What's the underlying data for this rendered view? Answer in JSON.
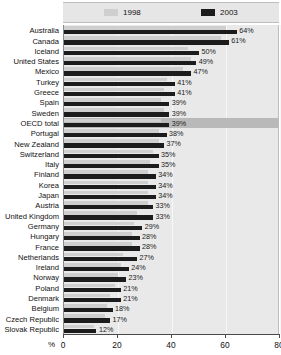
{
  "legend": {
    "entries": [
      {
        "label": "1998",
        "color": "#cfcfcf",
        "icon": "legend-swatch-1998"
      },
      {
        "label": "2003",
        "color": "#1c1c1c",
        "icon": "legend-swatch-2003"
      }
    ]
  },
  "axis": {
    "unit": "%",
    "ticks": [
      "0",
      "20",
      "40",
      "60",
      "80"
    ]
  },
  "chart_data": {
    "type": "bar",
    "orientation": "horizontal",
    "title": "",
    "subtitle": "",
    "xlabel": "%",
    "ylabel": "",
    "xlim": [
      0,
      80
    ],
    "grid": true,
    "legend_position": "top",
    "categories": [
      "Australia",
      "Canada",
      "Iceland",
      "United States",
      "Mexico",
      "Turkey",
      "Greece",
      "Spain",
      "Sweden",
      "OECD total",
      "Portugal",
      "New Zealand",
      "Switzerland",
      "Italy",
      "Finland",
      "Korea",
      "Japan",
      "Austria",
      "United Kingdom",
      "Germany",
      "Hungary",
      "France",
      "Netherlands",
      "Ireland",
      "Norway",
      "Poland",
      "Denmark",
      "Belgium",
      "Czech Republic",
      "Slovak Republic"
    ],
    "highlight_category": "OECD total",
    "series": [
      {
        "name": "1998",
        "color": "#cfcfcf",
        "values": [
          60,
          58,
          46,
          47,
          44,
          38,
          37,
          36,
          37,
          36,
          35,
          35,
          33,
          32,
          31,
          31,
          31,
          31,
          27,
          26,
          25,
          25,
          22,
          21,
          20,
          19,
          17,
          16,
          15,
          11
        ]
      },
      {
        "name": "2003",
        "color": "#1c1c1c",
        "values": [
          64,
          61,
          50,
          49,
          47,
          41,
          41,
          39,
          39,
          39,
          38,
          37,
          35,
          35,
          34,
          34,
          34,
          33,
          33,
          29,
          28,
          28,
          27,
          24,
          23,
          21,
          21,
          18,
          17,
          17
        ],
        "labels": [
          "64%",
          "61%",
          "50%",
          "49%",
          "47%",
          "41%",
          "41%",
          "39%",
          "39%",
          "39%",
          "38%",
          "37%",
          "35%",
          "35%",
          "34%",
          "34%",
          "34%",
          "33%",
          "33%",
          "29%",
          "28%",
          "28%",
          "27%",
          "24%",
          "23%",
          "21%",
          "21%",
          "18%",
          "17%",
          "17%"
        ]
      }
    ],
    "rows": [
      {
        "category": "Australia",
        "v1998": 60,
        "v2003": 64,
        "label": "64%"
      },
      {
        "category": "Canada",
        "v1998": 58,
        "v2003": 61,
        "label": "61%"
      },
      {
        "category": "Iceland",
        "v1998": 46,
        "v2003": 50,
        "label": "50%"
      },
      {
        "category": "United States",
        "v1998": 47,
        "v2003": 49,
        "label": "49%"
      },
      {
        "category": "Mexico",
        "v1998": 44,
        "v2003": 47,
        "label": "47%"
      },
      {
        "category": "Turkey",
        "v1998": 38,
        "v2003": 41,
        "label": "41%"
      },
      {
        "category": "Greece",
        "v1998": 37,
        "v2003": 41,
        "label": "41%"
      },
      {
        "category": "Spain",
        "v1998": 36,
        "v2003": 39,
        "label": "39%"
      },
      {
        "category": "Sweden",
        "v1998": 37,
        "v2003": 39,
        "label": "39%"
      },
      {
        "category": "OECD total",
        "v1998": 36,
        "v2003": 39,
        "label": "39%",
        "highlight": true
      },
      {
        "category": "Portugal",
        "v1998": 35,
        "v2003": 38,
        "label": "38%"
      },
      {
        "category": "New Zealand",
        "v1998": 35,
        "v2003": 37,
        "label": "37%"
      },
      {
        "category": "Switzerland",
        "v1998": 33,
        "v2003": 35,
        "label": "35%"
      },
      {
        "category": "Italy",
        "v1998": 32,
        "v2003": 35,
        "label": "35%"
      },
      {
        "category": "Finland",
        "v1998": 31,
        "v2003": 34,
        "label": "34%"
      },
      {
        "category": "Korea",
        "v1998": 31,
        "v2003": 34,
        "label": "34%"
      },
      {
        "category": "Japan",
        "v1998": 31,
        "v2003": 34,
        "label": "34%"
      },
      {
        "category": "Austria",
        "v1998": 31,
        "v2003": 33,
        "label": "33%"
      },
      {
        "category": "United Kingdom",
        "v1998": 27,
        "v2003": 33,
        "label": "33%"
      },
      {
        "category": "Germany",
        "v1998": 26,
        "v2003": 29,
        "label": "29%"
      },
      {
        "category": "Hungary",
        "v1998": 25,
        "v2003": 28,
        "label": "28%"
      },
      {
        "category": "France",
        "v1998": 25,
        "v2003": 28,
        "label": "28%"
      },
      {
        "category": "Netherlands",
        "v1998": 22,
        "v2003": 27,
        "label": "27%"
      },
      {
        "category": "Ireland",
        "v1998": 21,
        "v2003": 24,
        "label": "24%"
      },
      {
        "category": "Norway",
        "v1998": 20,
        "v2003": 23,
        "label": "23%"
      },
      {
        "category": "Poland",
        "v1998": 19,
        "v2003": 21,
        "label": "21%"
      },
      {
        "category": "Denmark",
        "v1998": 17,
        "v2003": 21,
        "label": "21%"
      },
      {
        "category": "Belgium",
        "v1998": 16,
        "v2003": 18,
        "label": "18%"
      },
      {
        "category": "Czech Republic",
        "v1998": 15,
        "v2003": 17,
        "label": "17%"
      },
      {
        "category": "Slovak Republic",
        "v1998": 11,
        "v2003": 12,
        "label": "12%"
      }
    ]
  }
}
